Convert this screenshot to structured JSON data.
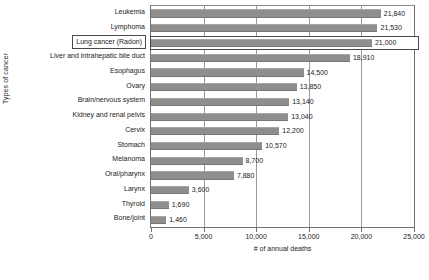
{
  "chart_data": {
    "type": "bar",
    "orientation": "horizontal",
    "title": "",
    "xlabel": "# of annual deaths",
    "ylabel": "Types of cancer",
    "xlim": [
      0,
      25000
    ],
    "xticks": [
      "0",
      "5,000",
      "10,000",
      "15,000",
      "20,000",
      "25,000"
    ],
    "xtick_values": [
      0,
      5000,
      10000,
      15000,
      20000,
      25000
    ],
    "grid": "vertical",
    "legend": "none",
    "bar_color": "#8e8e8e",
    "highlight_category": "Lung cancer (Radon)",
    "categories": [
      "Leukemia",
      "Lymphoma",
      "Lung cancer (Radon)",
      "Liver and intrahepatic bile duct",
      "Esophagus",
      "Ovary",
      "Brain/nervous system",
      "Kidney and renal pelvis",
      "Cervix",
      "Stomach",
      "Melanoma",
      "Oral/pharynx",
      "Larynx",
      "Thyroid",
      "Bone/joint"
    ],
    "values": [
      21840,
      21530,
      21000,
      18910,
      14500,
      13850,
      13140,
      13040,
      12200,
      10570,
      8700,
      7880,
      3600,
      1690,
      1460
    ],
    "value_labels": [
      "21,840",
      "21,530",
      "21,000",
      "18,910",
      "14,500",
      "13,850",
      "13,140",
      "13,040",
      "12,200",
      "10,570",
      "8,700",
      "7,880",
      "3,600",
      "1,690",
      "1,460"
    ]
  },
  "caption": ""
}
